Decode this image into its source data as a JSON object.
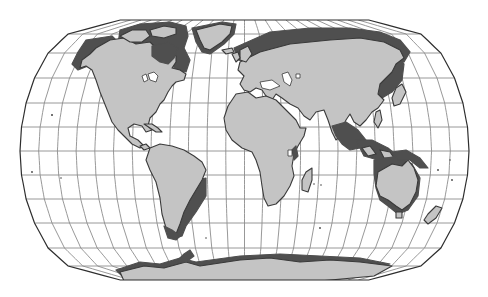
{
  "map": {
    "type": "world-map",
    "projection": "robinson-like pseudocylindrical",
    "graticule_interval_degrees": 15,
    "colors": {
      "background": "#ffffff",
      "land": "#c4c4c4",
      "coastal_shelf": "#4f4f4f",
      "graticule": "#8c8c8c",
      "outline": "#2e2e2e"
    },
    "continents": [
      "North America",
      "Greenland",
      "South America",
      "Europe",
      "Africa",
      "Asia",
      "Australia",
      "Antarctica",
      "Madagascar",
      "New Zealand",
      "Japan",
      "Indonesia",
      "Great Britain"
    ]
  }
}
